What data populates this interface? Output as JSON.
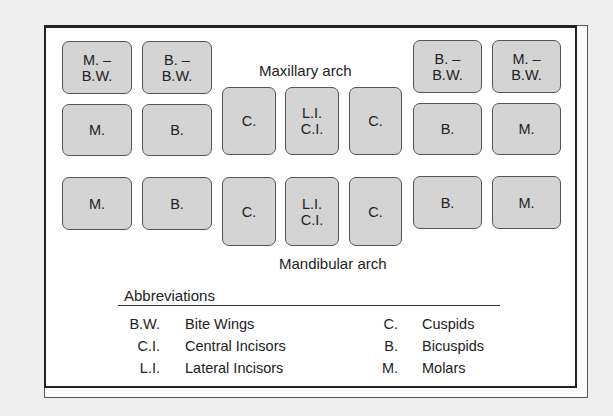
{
  "arches": {
    "maxillary_label": "Maxillary arch",
    "mandibular_label": "Mandibular arch"
  },
  "teeth": {
    "upper_bw": [
      {
        "label": "M. –\nB.W.",
        "x": 62,
        "y": 41,
        "w": 70,
        "h": 53
      },
      {
        "label": "B. –\nB.W.",
        "x": 142,
        "y": 41,
        "w": 70,
        "h": 53
      },
      {
        "label": "B. –\nB.W.",
        "x": 413,
        "y": 40,
        "w": 69,
        "h": 53
      },
      {
        "label": "M. –\nB.W.",
        "x": 492,
        "y": 40,
        "w": 69,
        "h": 53
      }
    ],
    "upper": [
      {
        "label": "M.",
        "x": 62,
        "y": 104,
        "w": 70,
        "h": 52
      },
      {
        "label": "B.",
        "x": 142,
        "y": 104,
        "w": 70,
        "h": 52
      },
      {
        "label": "C.",
        "x": 222,
        "y": 87,
        "w": 54,
        "h": 68
      },
      {
        "label": "L.I.\nC.I.",
        "x": 285,
        "y": 87,
        "w": 54,
        "h": 68
      },
      {
        "label": "C.",
        "x": 349,
        "y": 87,
        "w": 53,
        "h": 68
      },
      {
        "label": "B.",
        "x": 413,
        "y": 103,
        "w": 69,
        "h": 52
      },
      {
        "label": "M.",
        "x": 492,
        "y": 103,
        "w": 69,
        "h": 52
      }
    ],
    "lower": [
      {
        "label": "M.",
        "x": 62,
        "y": 177,
        "w": 70,
        "h": 53
      },
      {
        "label": "B.",
        "x": 142,
        "y": 177,
        "w": 70,
        "h": 53
      },
      {
        "label": "C.",
        "x": 222,
        "y": 177,
        "w": 54,
        "h": 69
      },
      {
        "label": "L.I.\nC.I.",
        "x": 285,
        "y": 177,
        "w": 54,
        "h": 69
      },
      {
        "label": "C.",
        "x": 349,
        "y": 177,
        "w": 53,
        "h": 69
      },
      {
        "label": "B.",
        "x": 413,
        "y": 176,
        "w": 69,
        "h": 53
      },
      {
        "label": "M.",
        "x": 492,
        "y": 176,
        "w": 69,
        "h": 53
      }
    ]
  },
  "abbreviations": {
    "title": "Abbreviations",
    "left": [
      {
        "code": "B.W.",
        "desc": "Bite Wings"
      },
      {
        "code": "C.I.",
        "desc": "Central Incisors"
      },
      {
        "code": "L.I.",
        "desc": "Lateral Incisors"
      }
    ],
    "right": [
      {
        "code": "C.",
        "desc": "Cuspids"
      },
      {
        "code": "B.",
        "desc": "Bicuspids"
      },
      {
        "code": "M.",
        "desc": "Molars"
      }
    ]
  }
}
